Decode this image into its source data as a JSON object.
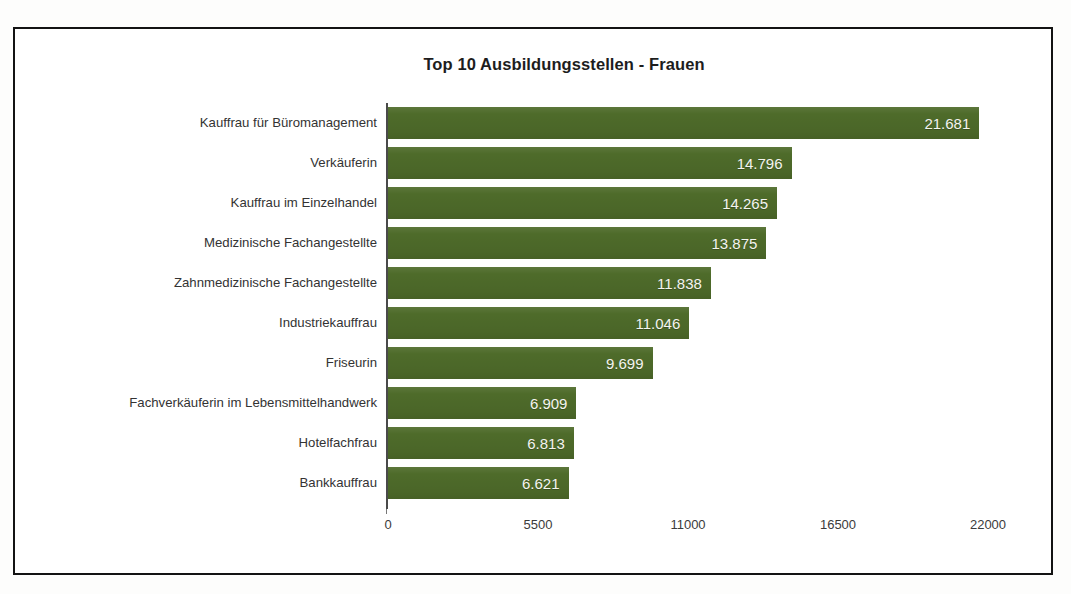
{
  "chart_data": {
    "type": "bar",
    "orientation": "horizontal",
    "title": "Top 10 Ausbildungsstellen - Frauen",
    "xlabel": "",
    "ylabel": "",
    "xlim": [
      0,
      22000
    ],
    "grid": false,
    "legend": false,
    "bar_color": "#4e6b2a",
    "value_label_color": "#f4f4f0",
    "categories": [
      "Kauffrau für Büromanagement",
      "Verkäuferin",
      "Kauffrau im Einzelhandel",
      "Medizinische Fachangestellte",
      "Zahnmedizinische Fachangestellte",
      "Industriekauffrau",
      "Friseurin",
      "Fachverkäuferin im Lebensmittelhandwerk",
      "Hotelfachfrau",
      "Bankkauffrau"
    ],
    "values": [
      21681,
      14796,
      14265,
      13875,
      11838,
      11046,
      9699,
      6909,
      6813,
      6621
    ],
    "value_labels": [
      "21.681",
      "14.796",
      "14.265",
      "13.875",
      "11.838",
      "11.046",
      "9.699",
      "6.909",
      "6.813",
      "6.621"
    ],
    "xticks": [
      0,
      5500,
      11000,
      16500,
      22000
    ],
    "xtick_labels": [
      "0",
      "5500",
      "11000",
      "16500",
      "22000"
    ]
  }
}
